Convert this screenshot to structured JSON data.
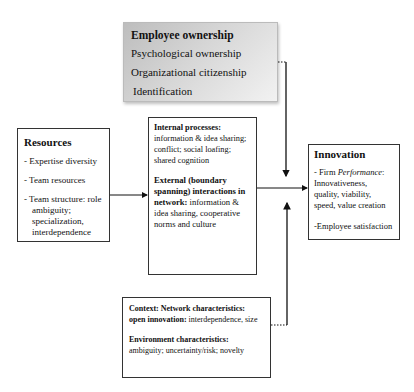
{
  "employee_ownership": {
    "title": "Employee ownership",
    "items": [
      "Psychological ownership",
      "Organizational citizenship",
      "Identification"
    ]
  },
  "resources": {
    "title": "Resources",
    "items": [
      {
        "first": "- Expertise diversity"
      },
      {
        "first": "- Team resources"
      },
      {
        "first": "- Team structure: role",
        "rest": "ambiguity; specialization, interdependence"
      }
    ]
  },
  "processes": {
    "internal_label": "Internal processes:",
    "internal_text": "information & idea sharing; conflict; social loafing; shared cognition",
    "external_label": "External (boundary spanning) interactions in network:",
    "external_text": " information & idea sharing, cooperative norms and culture"
  },
  "innovation": {
    "title": "Innovation",
    "firm_prefix": "- Firm ",
    "firm_italic": "Performance",
    "firm_suffix": ":",
    "firm_text": "Innovativeness, quality, viability, speed, value creation",
    "employee": "-Employee satisfaction"
  },
  "context": {
    "network_label": "Context: Network characteristics:",
    "open_label": "open innovation:",
    "open_text": " interdependence, size",
    "env_label": "Environment characteristics:",
    "env_text": "ambiguity; uncertainty/risk; novelty"
  },
  "colors": {
    "line": "#111111",
    "shaded_box_start": "#bdbdbd",
    "shaded_box_end": "#f2f2f2"
  }
}
